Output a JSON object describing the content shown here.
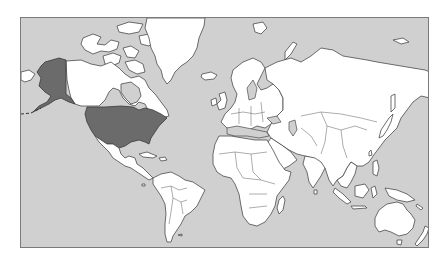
{
  "map": {
    "projection": "mercator-world",
    "frame": {
      "x": 20,
      "y": 17,
      "width": 409,
      "height": 231
    },
    "colors": {
      "page_background": "#ffffff",
      "ocean": "#d0d0d0",
      "land": "#ffffff",
      "outline": "#4a4a4a",
      "highlight": "#6b6b6b",
      "frame_border": "#7a7a7a"
    },
    "highlighted_regions": [
      {
        "id": "usa-contiguous",
        "label": "United States"
      },
      {
        "id": "alaska",
        "label": "Alaska"
      }
    ],
    "visible_landmasses": [
      "North America",
      "Greenland",
      "South America",
      "Europe",
      "Africa",
      "Asia",
      "Australia",
      "New Zealand",
      "Madagascar",
      "Iceland",
      "Japan",
      "Indonesia",
      "Philippines",
      "Arctic Archipelago"
    ]
  }
}
